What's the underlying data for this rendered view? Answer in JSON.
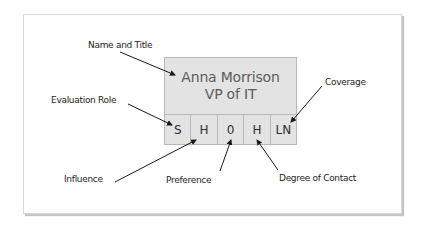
{
  "card": {
    "name": "Anna Morrison",
    "title": "VP of IT",
    "cells": [
      {
        "key": "evaluation_role",
        "value": "S"
      },
      {
        "key": "influence",
        "value": "H"
      },
      {
        "key": "preference",
        "value": "0"
      },
      {
        "key": "degree_of_contact",
        "value": "H"
      },
      {
        "key": "coverage",
        "value": "LN"
      }
    ]
  },
  "labels": {
    "name_and_title": "Name and Title",
    "evaluation_role": "Evaluation Role",
    "coverage": "Coverage",
    "influence": "Influence",
    "preference": "Preference",
    "degree_of_contact": "Degree of Contact"
  },
  "colors": {
    "card_fill": "#e3e3e3",
    "card_border": "#b8b8b8",
    "arrow": "#1a1a1a",
    "panel_border": "#d8d8d8"
  }
}
